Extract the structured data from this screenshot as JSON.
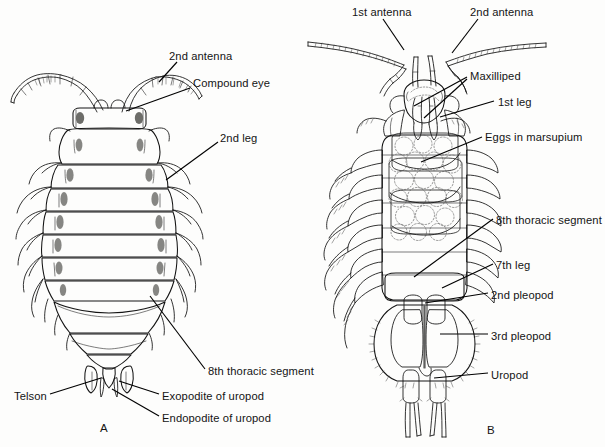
{
  "figure": {
    "panels": [
      {
        "id": "A",
        "letter": "A",
        "view": "dorsal view",
        "letter_x": 100,
        "letter_y": 422,
        "labels": [
          {
            "name": "second-antenna",
            "text": "2nd antenna",
            "x": 169,
            "y": 50,
            "anchor": "start",
            "leader": "M 177 62 L 159 82"
          },
          {
            "name": "compound-eye",
            "text": "Compound eye",
            "x": 193,
            "y": 77,
            "anchor": "start",
            "leader": "M 190 88 L 126 111"
          },
          {
            "name": "second-leg",
            "text": "2nd leg",
            "x": 220,
            "y": 132,
            "anchor": "start",
            "leader": "M 218 142 L 166 180"
          },
          {
            "name": "eighth-thoracic-segment-a",
            "text": "8th thoracic segment",
            "x": 208,
            "y": 365,
            "anchor": "start",
            "leader": "M 205 369 L 150 296"
          },
          {
            "name": "telson",
            "text": "Telson",
            "x": 14,
            "y": 390,
            "anchor": "start",
            "leader": "M 50 394 L 101 378"
          },
          {
            "name": "exopodite-of-uropod",
            "text": "Exopodite of uropod",
            "x": 162,
            "y": 390,
            "anchor": "start",
            "leader": "M 159 394 L 119 381"
          },
          {
            "name": "endopodite-of-uropod",
            "text": "Endopodite of uropod",
            "x": 162,
            "y": 412,
            "anchor": "start",
            "leader": "M 159 416 L 112 389"
          }
        ]
      },
      {
        "id": "B",
        "letter": "B",
        "view": "ventral view of female with marsupium",
        "letter_x": 487,
        "letter_y": 424,
        "labels": [
          {
            "name": "first-antenna",
            "text": "1st antenna",
            "x": 352,
            "y": 6,
            "anchor": "start",
            "leader": "M 383 19 L 404 50"
          },
          {
            "name": "second-antenna-b",
            "text": "2nd antenna",
            "x": 470,
            "y": 6,
            "anchor": "start",
            "leader": "M 478 19 L 452 53"
          },
          {
            "name": "maxilliped",
            "text": "Maxilliped",
            "x": 470,
            "y": 70,
            "anchor": "start",
            "leader": "M 467 77 L 414 106"
          },
          {
            "name": "maxilliped-2",
            "text": "",
            "x": 0,
            "y": 0,
            "anchor": "start",
            "leader": "M 467 79 L 424 118"
          },
          {
            "name": "first-leg",
            "text": "1st leg",
            "x": 498,
            "y": 96,
            "anchor": "start",
            "leader": "M 494 101 L 440 117"
          },
          {
            "name": "eggs-in-marsupium",
            "text": "Eggs in marsupium",
            "x": 485,
            "y": 131,
            "anchor": "start",
            "leader": "M 482 137 L 421 162"
          },
          {
            "name": "eighth-thoracic-segment-b",
            "text": "8th thoracic segment",
            "x": 496,
            "y": 214,
            "anchor": "start",
            "leader": "M 493 219 L 414 277"
          },
          {
            "name": "seventh-leg",
            "text": "7th leg",
            "x": 496,
            "y": 259,
            "anchor": "start",
            "leader": "M 493 264 L 442 288"
          },
          {
            "name": "second-pleopod",
            "text": "2nd pleopod",
            "x": 491,
            "y": 289,
            "anchor": "start",
            "leader": "M 488 293 L 425 303"
          },
          {
            "name": "third-pleopod",
            "text": "3rd pleopod",
            "x": 491,
            "y": 330,
            "anchor": "start",
            "leader": "M 488 334 L 440 334"
          },
          {
            "name": "uropod",
            "text": "Uropod",
            "x": 491,
            "y": 369,
            "anchor": "start",
            "leader": "M 488 373 L 434 378"
          }
        ]
      }
    ]
  },
  "colors": {
    "ink": "#101010",
    "paper": "#fdfdfc",
    "shade_dark": "#6d6d69",
    "shade_mid": "#cfcfcb",
    "shade_light": "#e3e3df"
  }
}
